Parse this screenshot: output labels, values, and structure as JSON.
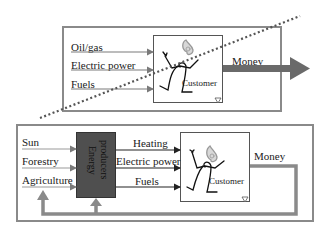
{
  "top_panel": {
    "inputs": [
      "Oil/gas",
      "Electric power",
      "Fuels"
    ],
    "customer_label": "Customer",
    "output_label": "Money"
  },
  "bottom_panel": {
    "sources": [
      "Sun",
      "Forestry",
      "Agriculture"
    ],
    "producer_label_line1": "Energy",
    "producer_label_line2": "producers",
    "outputs": [
      "Heating",
      "Electric power",
      "Fuels"
    ],
    "customer_label": "Customer",
    "output_label": "Money"
  },
  "colors": {
    "frame": "#8a8a8a",
    "arrow_gray": "#7a7a7a",
    "money_arrow": "#666666",
    "producer_box": "#4f4f4f",
    "dotted_line": "#555555"
  }
}
